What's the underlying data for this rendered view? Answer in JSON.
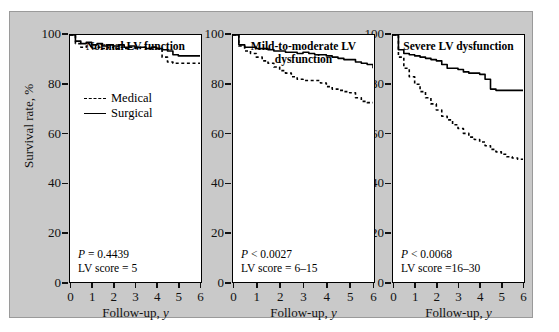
{
  "chart_data": {
    "type": "line",
    "xlabel": "Follow-up, y",
    "ylabel": "Survival rate, %",
    "xlim": [
      0,
      6
    ],
    "ylim": [
      0,
      100
    ],
    "xticks": [
      0,
      1,
      2,
      3,
      4,
      5,
      6
    ],
    "yticks": [
      0,
      20,
      40,
      60,
      80,
      100
    ],
    "grid": false,
    "legend_position": "inside-panel-1",
    "legend": [
      {
        "name": "Medical",
        "style": "dashed"
      },
      {
        "name": "Surgical",
        "style": "solid"
      }
    ],
    "panels": [
      {
        "title": "Normal LV function",
        "p_value": "P = 0.4439",
        "lv_score": "LV score = 5",
        "series": [
          {
            "name": "Surgical",
            "style": "solid",
            "x": [
              0,
              0.25,
              0.5,
              0.75,
              1.0,
              1.25,
              1.5,
              1.75,
              2.0,
              2.25,
              2.5,
              2.75,
              3.0,
              3.25,
              3.5,
              3.75,
              4.0,
              4.25,
              4.5,
              4.75,
              5.0,
              5.25,
              5.5,
              5.75,
              6.0
            ],
            "values": [
              100,
              97.5,
              96.5,
              97.0,
              96.0,
              96.5,
              95.5,
              96.0,
              95.5,
              96.0,
              95.0,
              95.5,
              95.0,
              95.0,
              94.5,
              95.0,
              94.5,
              94.0,
              93.5,
              92.0,
              91.5,
              91.5,
              91.5,
              91.5,
              91.5
            ]
          },
          {
            "name": "Medical",
            "style": "dashed",
            "x": [
              0,
              0.25,
              0.5,
              0.75,
              1.0,
              1.25,
              1.5,
              1.75,
              2.0,
              2.25,
              2.5,
              2.75,
              3.0,
              3.25,
              3.5,
              3.75,
              4.0,
              4.25,
              4.5,
              4.75,
              5.0,
              5.25,
              5.5,
              5.75,
              6.0
            ],
            "values": [
              100,
              96.5,
              95.0,
              95.5,
              94.5,
              95.0,
              94.5,
              95.0,
              94.5,
              95.0,
              94.5,
              95.0,
              94.5,
              95.0,
              94.5,
              95.0,
              94.5,
              91.0,
              89.0,
              88.5,
              88.5,
              88.5,
              88.5,
              88.5,
              88.5
            ]
          }
        ]
      },
      {
        "title": "Mild-to-moderate LV dysfunction",
        "p_value": "P < 0.0027",
        "lv_score": "LV score = 6–15",
        "series": [
          {
            "name": "Surgical",
            "style": "solid",
            "x": [
              0,
              0.25,
              0.5,
              0.75,
              1.0,
              1.25,
              1.5,
              1.75,
              2.0,
              2.25,
              2.5,
              2.75,
              3.0,
              3.25,
              3.5,
              3.75,
              4.0,
              4.25,
              4.5,
              4.75,
              5.0,
              5.25,
              5.5,
              5.75,
              6.0
            ],
            "values": [
              100,
              96.0,
              95.0,
              95.0,
              94.5,
              94.5,
              94.0,
              93.5,
              93.5,
              93.0,
              93.0,
              92.5,
              93.0,
              92.5,
              92.0,
              92.0,
              91.5,
              91.0,
              90.5,
              90.0,
              90.0,
              89.0,
              88.5,
              88.0,
              86.5
            ]
          },
          {
            "name": "Medical",
            "style": "dashed",
            "x": [
              0,
              0.25,
              0.5,
              0.75,
              1.0,
              1.25,
              1.5,
              1.75,
              2.0,
              2.25,
              2.5,
              2.75,
              3.0,
              3.25,
              3.5,
              3.75,
              4.0,
              4.25,
              4.5,
              4.75,
              5.0,
              5.25,
              5.5,
              5.75,
              6.0
            ],
            "values": [
              100,
              95.5,
              93.5,
              92.5,
              91.0,
              89.5,
              88.5,
              87.0,
              85.5,
              84.5,
              83.0,
              82.0,
              81.5,
              81.5,
              81.5,
              80.5,
              79.0,
              78.0,
              77.5,
              77.0,
              76.5,
              74.5,
              73.0,
              72.5,
              72.5
            ]
          }
        ]
      },
      {
        "title": "Severe LV dysfunction",
        "p_value": "P < 0.0068",
        "lv_score": "LV score =16–30",
        "series": [
          {
            "name": "Surgical",
            "style": "solid",
            "x": [
              0,
              0.25,
              0.5,
              0.75,
              1.0,
              1.25,
              1.5,
              1.75,
              2.0,
              2.25,
              2.5,
              2.75,
              3.0,
              3.25,
              3.5,
              3.75,
              4.0,
              4.25,
              4.5,
              4.75,
              5.0,
              5.25,
              5.5,
              5.75,
              6.0
            ],
            "values": [
              100,
              94.0,
              92.5,
              92.0,
              91.5,
              91.0,
              90.5,
              90.0,
              89.5,
              88.0,
              86.5,
              86.5,
              86.0,
              85.0,
              84.5,
              84.5,
              84.0,
              82.0,
              78.0,
              77.5,
              77.5,
              77.5,
              77.5,
              77.5,
              77.5
            ]
          },
          {
            "name": "Medical",
            "style": "dashed",
            "x": [
              0,
              0.25,
              0.5,
              0.75,
              1.0,
              1.25,
              1.5,
              1.75,
              2.0,
              2.25,
              2.5,
              2.75,
              3.0,
              3.25,
              3.5,
              3.75,
              4.0,
              4.25,
              4.5,
              4.75,
              5.0,
              5.25,
              5.5,
              5.75,
              6.0
            ],
            "values": [
              100,
              91.0,
              86.5,
              83.0,
              80.0,
              77.0,
              74.5,
              72.0,
              69.5,
              67.0,
              65.5,
              63.5,
              62.0,
              60.0,
              58.5,
              57.5,
              56.5,
              55.0,
              53.5,
              52.5,
              51.5,
              50.5,
              50.0,
              49.5,
              49.5
            ]
          }
        ]
      }
    ]
  }
}
